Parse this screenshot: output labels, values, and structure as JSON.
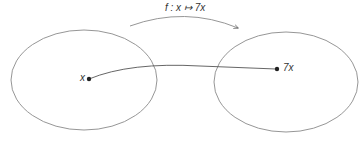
{
  "diagram": {
    "function_label": "f : x ↦ 7x",
    "domain_point_label": "x",
    "codomain_point_label": "7x",
    "colors": {
      "stroke": "#8a8a8a",
      "point": "#222222",
      "text": "#333333",
      "background": "#ffffff"
    }
  }
}
